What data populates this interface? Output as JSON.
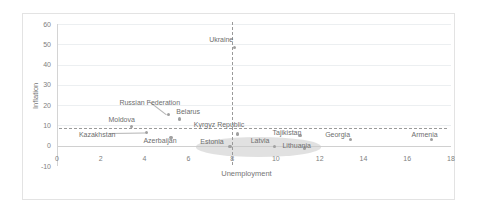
{
  "chart_data": {
    "type": "scatter",
    "title": "",
    "xlabel": "Unemployment",
    "ylabel": "Inflation",
    "xlim": [
      0,
      18
    ],
    "ylim": [
      -10,
      60
    ],
    "xticks": [
      "0",
      "2",
      "4",
      "6",
      "8",
      "10",
      "12",
      "14",
      "16",
      "18"
    ],
    "yticks": [
      "60",
      "50",
      "40",
      "30",
      "20",
      "10",
      "0",
      "-10"
    ],
    "grid": "horizontal",
    "legend": "none",
    "points": [
      {
        "label": "Kazakhstan",
        "x": 4.1,
        "y": 6.4,
        "lx": 1.0,
        "ly": 5.2,
        "leader": true
      },
      {
        "label": "Moldova",
        "x": 3.4,
        "y": 9.6,
        "lx": 2.35,
        "ly": 12.6,
        "leader": false
      },
      {
        "label": "Azerbaijan",
        "x": 5.2,
        "y": 4.0,
        "lx": 3.95,
        "ly": 2.2,
        "leader": false
      },
      {
        "label": "Russian Federation",
        "x": 5.1,
        "y": 15.5,
        "lx": 2.85,
        "ly": 21.0,
        "leader": true
      },
      {
        "label": "Belarus",
        "x": 5.6,
        "y": 13.2,
        "lx": 5.45,
        "ly": 16.4,
        "leader": false
      },
      {
        "label": "Ukraine",
        "x": 8.1,
        "y": 48.3,
        "lx": 6.95,
        "ly": 52.0,
        "leader": false
      },
      {
        "label": "Kyrgyz Republic",
        "x": 8.25,
        "y": 5.7,
        "lx": 6.25,
        "ly": 10.2,
        "leader": false
      },
      {
        "label": "Estonia",
        "x": 7.9,
        "y": -0.5,
        "lx": 6.55,
        "ly": 1.6,
        "leader": false
      },
      {
        "label": "Latvia",
        "x": 9.95,
        "y": -0.3,
        "lx": 8.85,
        "ly": 2.1,
        "leader": false
      },
      {
        "label": "Lithuania",
        "x": 11.3,
        "y": -1.1,
        "lx": 10.3,
        "ly": -0.1,
        "leader": false
      },
      {
        "label": "Tajikistan",
        "x": 11.1,
        "y": 5.0,
        "lx": 9.85,
        "ly": 6.4,
        "leader": false
      },
      {
        "label": "Georgia",
        "x": 13.4,
        "y": 3.1,
        "lx": 12.25,
        "ly": 5.1,
        "leader": false
      },
      {
        "label": "Armenia",
        "x": 17.1,
        "y": 3.0,
        "lx": 16.2,
        "ly": 5.1,
        "leader": false
      }
    ],
    "reference_lines": {
      "horizontal_value": 8.7,
      "vertical_value": 8.0
    },
    "highlight_ellipse": {
      "center_x": 9.2,
      "center_y": -0.7,
      "width_x": 5.7,
      "height_y": 9.6
    }
  }
}
